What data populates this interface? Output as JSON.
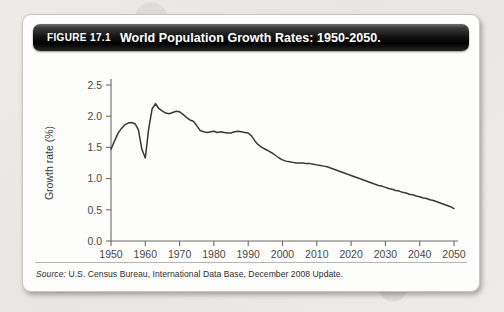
{
  "figure": {
    "number_label": "FIGURE 17.1",
    "title": "World Population Growth Rates: 1950-2050.",
    "source_label": "Source:",
    "source_text": "U.S. Census Bureau, International Data Base, December 2008 Update."
  },
  "colors": {
    "header_bar": "#121212",
    "header_text": "#ffffff",
    "panel_bg": "#fdfdfc",
    "page_bg": "#eceae7",
    "line": "#39373a",
    "axis": "#6d6a67"
  },
  "chart_data": {
    "type": "line",
    "title": "World Population Growth Rates: 1950-2050.",
    "xlabel": "Year",
    "ylabel": "Growth rate (%)",
    "xlim": [
      1950,
      2050
    ],
    "ylim": [
      0.0,
      2.5
    ],
    "xticks": [
      1950,
      1960,
      1970,
      1980,
      1990,
      2000,
      2010,
      2020,
      2030,
      2040,
      2050
    ],
    "yticks": [
      "0.0",
      "0.5",
      "1.0",
      "1.5",
      "2.0",
      "2.5"
    ],
    "grid": false,
    "legend": "none",
    "series": [
      {
        "name": "World population growth rate",
        "x": [
          1950,
          1951,
          1952,
          1953,
          1954,
          1955,
          1956,
          1957,
          1958,
          1959,
          1960,
          1961,
          1962,
          1963,
          1964,
          1965,
          1966,
          1967,
          1968,
          1969,
          1970,
          1971,
          1972,
          1973,
          1974,
          1975,
          1976,
          1977,
          1978,
          1979,
          1980,
          1981,
          1982,
          1983,
          1984,
          1985,
          1986,
          1987,
          1988,
          1989,
          1990,
          1991,
          1992,
          1993,
          1994,
          1995,
          1996,
          1997,
          1998,
          1999,
          2000,
          2001,
          2002,
          2003,
          2004,
          2005,
          2006,
          2007,
          2008,
          2009,
          2010,
          2011,
          2012,
          2013,
          2014,
          2015,
          2016,
          2017,
          2018,
          2019,
          2020,
          2021,
          2022,
          2023,
          2024,
          2025,
          2026,
          2027,
          2028,
          2029,
          2030,
          2031,
          2032,
          2033,
          2034,
          2035,
          2036,
          2037,
          2038,
          2039,
          2040,
          2041,
          2042,
          2043,
          2044,
          2045,
          2046,
          2047,
          2048,
          2049,
          2050
        ],
        "values": [
          1.47,
          1.6,
          1.72,
          1.8,
          1.86,
          1.89,
          1.9,
          1.88,
          1.78,
          1.47,
          1.33,
          1.8,
          2.12,
          2.2,
          2.12,
          2.08,
          2.05,
          2.04,
          2.06,
          2.08,
          2.07,
          2.03,
          1.98,
          1.94,
          1.92,
          1.85,
          1.77,
          1.75,
          1.74,
          1.75,
          1.76,
          1.74,
          1.75,
          1.74,
          1.73,
          1.73,
          1.75,
          1.76,
          1.75,
          1.74,
          1.73,
          1.68,
          1.6,
          1.54,
          1.5,
          1.47,
          1.44,
          1.41,
          1.37,
          1.33,
          1.3,
          1.28,
          1.27,
          1.26,
          1.25,
          1.25,
          1.25,
          1.24,
          1.24,
          1.23,
          1.22,
          1.21,
          1.2,
          1.19,
          1.17,
          1.15,
          1.13,
          1.11,
          1.09,
          1.07,
          1.05,
          1.03,
          1.01,
          0.99,
          0.97,
          0.95,
          0.93,
          0.91,
          0.89,
          0.88,
          0.86,
          0.84,
          0.83,
          0.81,
          0.8,
          0.78,
          0.77,
          0.75,
          0.74,
          0.72,
          0.71,
          0.69,
          0.68,
          0.66,
          0.65,
          0.63,
          0.61,
          0.59,
          0.57,
          0.55,
          0.52
        ]
      }
    ],
    "annotations": []
  }
}
